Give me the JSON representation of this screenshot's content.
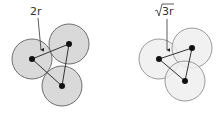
{
  "left_diagram": {
    "label": "2r",
    "description": "Three touching circles; center distance 2r",
    "circle_fill": "#d9d9d9",
    "circle_stroke": "#777777"
  },
  "right_diagram": {
    "label_radical": "√",
    "label_rest": "3r",
    "description": "Three overlapping circles; center distance √3 r",
    "circle_fill": "#eeeeee",
    "circle_stroke": "#999999"
  }
}
